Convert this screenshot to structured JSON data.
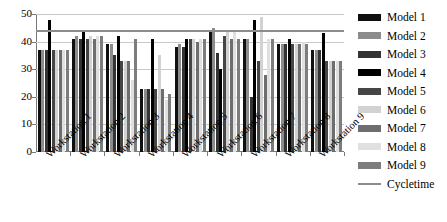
{
  "chart_data": {
    "type": "bar",
    "title": "",
    "xlabel": "",
    "ylabel": "",
    "ylim": [
      0,
      50
    ],
    "yticks": [
      0,
      10,
      20,
      30,
      40,
      50
    ],
    "grid": true,
    "legend_position": "right",
    "categories": [
      "Workstation 1",
      "Workstation 2",
      "Workstation 3",
      "Workstation 4",
      "Workstation 5",
      "Workstation 6",
      "Workstation 7",
      "Workstation 8",
      "Workstation 9"
    ],
    "series": [
      {
        "name": "Model 1",
        "color": "#101010",
        "values": [
          37,
          41,
          39,
          23,
          38,
          44,
          41,
          39,
          37
        ]
      },
      {
        "name": "Model 2",
        "color": "#8c8c8c",
        "values": [
          37,
          42,
          39,
          23,
          39,
          45,
          41,
          39,
          37
        ]
      },
      {
        "name": "Model 3",
        "color": "#333333",
        "values": [
          37,
          41,
          35,
          23,
          38,
          36,
          20,
          39,
          37
        ]
      },
      {
        "name": "Model 4",
        "color": "#000000",
        "values": [
          48,
          44,
          42,
          41,
          41,
          30,
          48,
          41,
          43
        ]
      },
      {
        "name": "Model 5",
        "color": "#454545",
        "values": [
          37,
          41,
          33,
          23,
          41,
          42,
          33,
          39,
          33
        ]
      },
      {
        "name": "Model 6",
        "color": "#d2d2d2",
        "values": [
          37,
          42,
          33,
          35,
          41,
          44,
          49,
          39,
          33
        ]
      },
      {
        "name": "Model 7",
        "color": "#6e6e6e",
        "values": [
          37,
          41,
          33,
          23,
          40,
          41,
          28,
          39,
          33
        ]
      },
      {
        "name": "Model 8",
        "color": "#e0e0e0",
        "values": [
          37,
          42,
          26,
          19,
          41,
          44,
          41,
          40,
          33
        ]
      },
      {
        "name": "Model 9",
        "color": "#7d7d7d",
        "values": [
          37,
          42,
          41,
          21,
          41,
          41,
          41,
          39,
          33
        ]
      }
    ],
    "reference_line": {
      "name": "Cycletime",
      "value": 44,
      "color": "#8c8c8c"
    }
  },
  "legend": {
    "entries": [
      {
        "label": "Model 1"
      },
      {
        "label": "Model 2"
      },
      {
        "label": "Model 3"
      },
      {
        "label": "Model 4"
      },
      {
        "label": "Model 5"
      },
      {
        "label": "Model 6"
      },
      {
        "label": "Model 7"
      },
      {
        "label": "Model 8"
      },
      {
        "label": "Model 9"
      },
      {
        "label": "Cycletime"
      }
    ]
  }
}
